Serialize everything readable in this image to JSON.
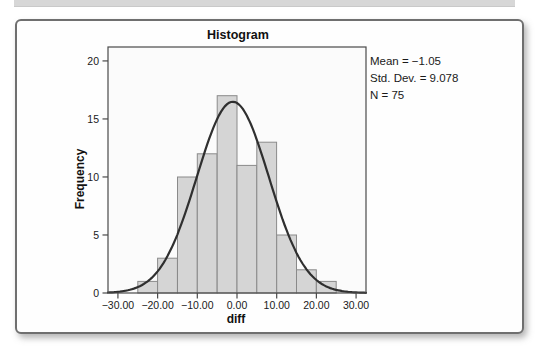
{
  "page": {
    "top_strip_color": "#d7d7d7"
  },
  "stats": {
    "lines": [
      "Mean = −1.05",
      "Std. Dev. = 9.078",
      "N = 75"
    ]
  },
  "chart_data": {
    "type": "bar",
    "variant": "histogram",
    "title": "Histogram",
    "xlabel": "diff",
    "ylabel": "Frequency",
    "bin_width": 5,
    "bin_left_edges": [
      -25,
      -20,
      -15,
      -10,
      -5,
      0,
      5,
      10,
      15,
      20
    ],
    "values": [
      1,
      3,
      10,
      12,
      17,
      11,
      13,
      5,
      2,
      1
    ],
    "x_ticks": [
      -30,
      -20,
      -10,
      0,
      10,
      20,
      30
    ],
    "x_tick_labels": [
      "−30.00",
      "−20.00",
      "−10.00",
      "0.00",
      "10.00",
      "20.00",
      "30.00"
    ],
    "y_ticks": [
      0,
      5,
      10,
      15,
      20
    ],
    "xlim": [
      -32.5,
      32.5
    ],
    "ylim": [
      0,
      21.2
    ],
    "grid": false,
    "legend": "none",
    "normal_curve": {
      "mean": -1.05,
      "std_dev": 9.078,
      "n": 75
    },
    "colors": {
      "bar_fill": "#d5d5d5",
      "bar_stroke": "#8a8a8a",
      "curve": "#2f2f2f",
      "frame": "#4a4a4a",
      "plot_bg": "#fbfbfb",
      "text": "#1a1a1a"
    }
  }
}
